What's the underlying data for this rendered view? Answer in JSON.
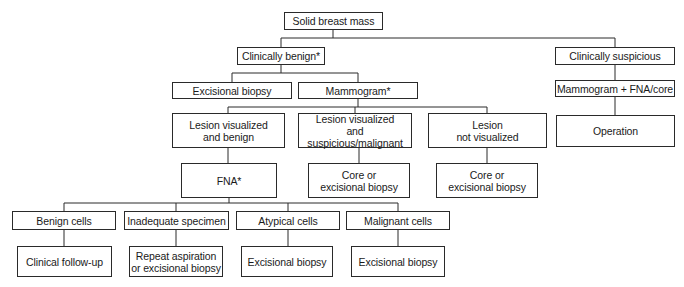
{
  "nodes": {
    "root": {
      "label": "Solid breast mass"
    },
    "clinically_benign": {
      "label": "Clinically benign*"
    },
    "clinically_suspicious": {
      "label": "Clinically suspicious"
    },
    "excisional_biopsy_1": {
      "label": "Excisional biopsy"
    },
    "mammogram": {
      "label": "Mammogram*"
    },
    "mammogram_fna_core": {
      "label": "Mammogram + FNA/core"
    },
    "operation": {
      "label": "Operation"
    },
    "lesion_benign": {
      "line1": "Lesion visualized",
      "line2": "and benign"
    },
    "lesion_suspicious": {
      "line1": "Lesion visualized",
      "line2": "and suspicious/malignant"
    },
    "lesion_not_visualized": {
      "line1": "Lesion",
      "line2": "not visualized"
    },
    "fna": {
      "label": "FNA*"
    },
    "core_excisional_1": {
      "line1": "Core or",
      "line2": "excisional biopsy"
    },
    "core_excisional_2": {
      "line1": "Core or",
      "line2": "excisional biopsy"
    },
    "benign_cells": {
      "label": "Benign cells"
    },
    "inadequate_specimen": {
      "label": "Inadequate specimen"
    },
    "atypical_cells": {
      "label": "Atypical cells"
    },
    "malignant_cells": {
      "label": "Malignant cells"
    },
    "clinical_followup": {
      "label": "Clinical follow-up"
    },
    "repeat_aspiration": {
      "line1": "Repeat aspiration",
      "line2": "or excisional biopsy"
    },
    "excisional_biopsy_atypical": {
      "label": "Excisional biopsy"
    },
    "excisional_biopsy_malignant": {
      "label": "Excisional biopsy"
    }
  },
  "edges": [
    [
      "root",
      "clinically_benign"
    ],
    [
      "root",
      "clinically_suspicious"
    ],
    [
      "clinically_benign",
      "excisional_biopsy_1"
    ],
    [
      "clinically_benign",
      "mammogram"
    ],
    [
      "clinically_suspicious",
      "mammogram_fna_core"
    ],
    [
      "mammogram_fna_core",
      "operation"
    ],
    [
      "mammogram",
      "lesion_benign"
    ],
    [
      "mammogram",
      "lesion_suspicious"
    ],
    [
      "mammogram",
      "lesion_not_visualized"
    ],
    [
      "lesion_benign",
      "fna"
    ],
    [
      "lesion_suspicious",
      "core_excisional_1"
    ],
    [
      "lesion_not_visualized",
      "core_excisional_2"
    ],
    [
      "fna",
      "benign_cells"
    ],
    [
      "fna",
      "inadequate_specimen"
    ],
    [
      "fna",
      "atypical_cells"
    ],
    [
      "fna",
      "malignant_cells"
    ],
    [
      "benign_cells",
      "clinical_followup"
    ],
    [
      "inadequate_specimen",
      "repeat_aspiration"
    ],
    [
      "atypical_cells",
      "excisional_biopsy_atypical"
    ],
    [
      "malignant_cells",
      "excisional_biopsy_malignant"
    ]
  ],
  "colors": {
    "line": "#2a2a2a",
    "text": "#1a1a1a",
    "background": "#ffffff"
  }
}
